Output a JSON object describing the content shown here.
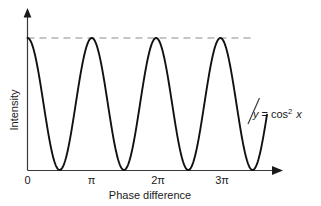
{
  "figure": {
    "background_color": "#ffffff",
    "width": 321,
    "height": 206
  },
  "axes": {
    "x_axis_title": "Phase difference",
    "y_axis_title": "Intensity",
    "x_tick_labels": [
      "0",
      "π",
      "2π",
      "3π"
    ],
    "x_tick_values": [
      0,
      3.14159,
      6.28319,
      9.42478
    ],
    "axis_color": "#3a3a3a",
    "arrowheads": [
      "x-right",
      "y-up"
    ]
  },
  "annotation": {
    "equation_y": "y",
    "equation_eq": "=",
    "equation_fn": "cos",
    "equation_exp": "2",
    "equation_var": "x",
    "equation_full": "y = cos² x",
    "leader_line": true
  },
  "guide": {
    "dashed_line_label": "peak intensity level",
    "color": "#8c8c8c"
  },
  "chart_data": {
    "type": "line",
    "title": "",
    "subtitle": "",
    "xlabel": "Phase difference",
    "ylabel": "Intensity",
    "xlim": [
      0,
      11.7
    ],
    "ylim": [
      0,
      1.0
    ],
    "grid": false,
    "legend": "none",
    "curve_color": "#111111",
    "annotations": [
      {
        "text": "y = cos² x",
        "x": 10.3,
        "y": 0.43,
        "leader_to_curve": true
      },
      {
        "text": "dashed maximum guide line",
        "y": 1.0,
        "x_start": 0,
        "x_end": 11.0,
        "style": "dashed"
      }
    ],
    "series": [
      {
        "name": "y = cos² x",
        "formula": "cos(x)^2",
        "x_unit": "radians",
        "x_start": 0,
        "x_end": 11.7,
        "x": [
          0,
          0.3927,
          0.7854,
          1.1781,
          1.5708,
          1.9635,
          2.3562,
          2.7489,
          3.14159,
          3.5343,
          3.927,
          4.3197,
          4.7124,
          5.1051,
          5.4978,
          5.8905,
          6.28319,
          6.6759,
          7.0686,
          7.4613,
          7.854,
          8.2467,
          8.6394,
          9.0321,
          9.42478,
          9.8175,
          10.2102,
          10.6029,
          10.9956,
          11.3883,
          11.7
        ],
        "y": [
          1.0,
          0.8536,
          0.5,
          0.1464,
          0.0,
          0.1464,
          0.5,
          0.8536,
          1.0,
          0.8536,
          0.5,
          0.1464,
          0.0,
          0.1464,
          0.5,
          0.8536,
          1.0,
          0.8536,
          0.5,
          0.1464,
          0.0,
          0.1464,
          0.5,
          0.8536,
          1.0,
          0.8536,
          0.5,
          0.1464,
          0.0,
          0.1464,
          0.32
        ]
      }
    ],
    "maxima_at": [
      "0",
      "2π"
    ],
    "minima_at": [
      "π",
      "3π"
    ],
    "period": "π"
  }
}
